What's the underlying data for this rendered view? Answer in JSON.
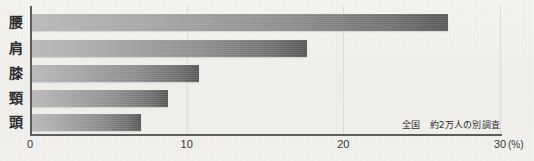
{
  "chart_data": {
    "type": "bar",
    "orientation": "horizontal",
    "title": "",
    "subtitle": "",
    "xlabel": "(%)",
    "ylabel": "",
    "categories": [
      "腰",
      "肩",
      "膝",
      "頸",
      "頭"
    ],
    "values": [
      26.7,
      17.7,
      10.8,
      8.8,
      7.1
    ],
    "series": [
      {
        "name": "",
        "values": [
          26.7,
          17.7,
          10.8,
          8.8,
          7.1
        ]
      }
    ],
    "xlim": [
      0,
      30
    ],
    "xticks": [
      0,
      10,
      20,
      30
    ],
    "xtick_labels": [
      "0",
      "10",
      "20",
      "30"
    ],
    "grid": true,
    "grid_axis": "x",
    "legend": false,
    "annotations": [
      "全国　約2万人の別調査"
    ],
    "bar_color_start": "#b9b9b9",
    "bar_color_end": "#575757",
    "axis_color": "#5d5d5d",
    "background_color": "#f1f0ec"
  },
  "axis": {
    "unit": "(%)",
    "ticks": [
      {
        "label": "0",
        "value": 0
      },
      {
        "label": "10",
        "value": 10
      },
      {
        "label": "20",
        "value": 20
      },
      {
        "label": "30",
        "value": 30
      }
    ]
  },
  "bars": [
    {
      "label": "腰",
      "value": 26.7
    },
    {
      "label": "肩",
      "value": 17.7
    },
    {
      "label": "膝",
      "value": 10.8
    },
    {
      "label": "頸",
      "value": 8.8
    },
    {
      "label": "頭",
      "value": 7.1
    }
  ],
  "note": {
    "text": "全国　約2万人の別調査"
  }
}
